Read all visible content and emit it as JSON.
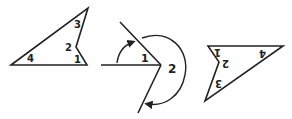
{
  "figures": {
    "left_quad": {
      "labels": [
        "4",
        "2",
        "3",
        "1"
      ]
    },
    "middle_angles": {
      "labels": [
        "1",
        "2"
      ]
    },
    "right_quad": {
      "labels": [
        "4",
        "2",
        "3",
        "1"
      ]
    }
  },
  "colors": {
    "stroke": "#222222",
    "background": "#ffffff"
  }
}
